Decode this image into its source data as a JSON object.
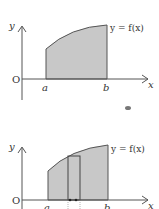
{
  "diagrams": [
    {
      "id": "area-under-curve",
      "y_axis_label": "y",
      "x_axis_label": "x",
      "origin_label": "O",
      "a_label": "a",
      "b_label": "b",
      "curve_label": "y = f(x)"
    },
    {
      "id": "area-with-strip",
      "y_axis_label": "y",
      "x_axis_label": "x",
      "origin_label": "O",
      "a_label": "a",
      "b_label": "b",
      "curve_label": "y = f(x)"
    }
  ],
  "colors": {
    "shade": "#c8c8c8",
    "line": "#555555",
    "text": "#333333"
  }
}
